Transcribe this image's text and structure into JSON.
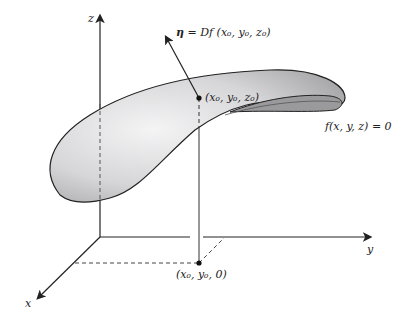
{
  "axes": {
    "x_label": "x",
    "y_label": "y",
    "z_label": "z"
  },
  "labels": {
    "normal_vector": "η = Df (x₀, y₀, z₀)",
    "normal_eta": "η",
    "normal_rest": " = Df (x₀, y₀, z₀)",
    "surface_point": "(x₀, y₀, z₀)",
    "projection_point": "(x₀, y₀, 0)",
    "surface_equation": "f(x, y, z) = 0"
  },
  "colors": {
    "surface_fill": "#d9d9db",
    "surface_inner": "#9a9a9c",
    "line": "#222222"
  }
}
